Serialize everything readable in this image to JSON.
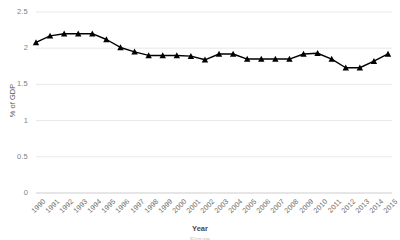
{
  "chart_data": {
    "type": "line",
    "title": "",
    "xlabel": "Year",
    "ylabel": "% of GDP",
    "ylim": [
      0,
      2.5
    ],
    "yticks": [
      "0",
      "0.5",
      "1",
      "1.5",
      "2",
      "2.5"
    ],
    "ytick_values": [
      0,
      0.5,
      1,
      1.5,
      2,
      2.5
    ],
    "grid": true,
    "legend": "none",
    "marker": "triangle",
    "line_color": "#000000",
    "marker_color": "#000000",
    "grid_color": "#e8e8e8",
    "categories": [
      "1990",
      "1991",
      "1992",
      "1993",
      "1994",
      "1995",
      "1996",
      "1997",
      "1998",
      "1999",
      "2000",
      "2001",
      "2002",
      "2003",
      "2004",
      "2005",
      "2006",
      "2007",
      "2008",
      "2009",
      "2010",
      "2011",
      "2012",
      "2013",
      "2014",
      "2015"
    ],
    "values": [
      2.08,
      2.17,
      2.2,
      2.2,
      2.2,
      2.12,
      2.01,
      1.95,
      1.9,
      1.9,
      1.9,
      1.89,
      1.84,
      1.92,
      1.92,
      1.85,
      1.85,
      1.85,
      1.85,
      1.92,
      1.93,
      1.85,
      1.73,
      1.73,
      1.82,
      1.92
    ]
  },
  "axis": {
    "x_axis_label": "Year",
    "y_axis_label": "% of GDP"
  },
  "caption": {
    "partial_text": "Figure"
  }
}
